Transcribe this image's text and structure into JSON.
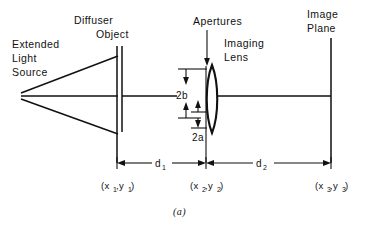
{
  "figure": {
    "panel_label": "(a)",
    "caption_position": "bottom-center",
    "background": "#ffffff",
    "ink_color": "#111111"
  },
  "labels": {
    "source_line1": "Extended",
    "source_line2": "Light",
    "source_line3": "Source",
    "diffuser": "Diffuser",
    "object": "Object",
    "apertures": "Apertures",
    "imaging_line1": "Imaging",
    "imaging_line2": "Lens",
    "image_plane_line1": "Image",
    "image_plane_line2": "Plane"
  },
  "dimensions": {
    "aperture_large": "2b",
    "aperture_small": "2a",
    "distance_1_base": "d",
    "distance_1_sub": "1",
    "distance_2_base": "d",
    "distance_2_sub": "2"
  },
  "coordinates": {
    "plane1_open": "(x",
    "plane1_sub_x": "1",
    "plane1_comma": ",y",
    "plane1_sub_y": "1",
    "plane1_close": ")",
    "plane2_open": "(x",
    "plane2_sub_x": "2",
    "plane2_comma": ",y",
    "plane2_sub_y": "2",
    "plane2_close": ")",
    "plane3_open": "(x",
    "plane3_sub_x": "3",
    "plane3_comma": ",y",
    "plane3_sub_y": "3",
    "plane3_close": ")"
  },
  "geometry": {
    "optical_axis_y": 96,
    "source_apex_x": 21,
    "diffuser_x": 117,
    "object_x": 122,
    "aperture_plane_x": 206,
    "lens_center_x": 212,
    "image_plane_x": 331,
    "lens_top_y": 65,
    "lens_bottom_y": 133,
    "aperture_2b_top_y": 69,
    "aperture_2b_bottom_y": 118,
    "aperture_2a_top_y": 112,
    "aperture_2a_bottom_y": 128,
    "dimension_line_y": 163
  }
}
